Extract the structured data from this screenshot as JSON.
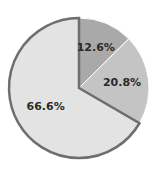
{
  "chart_data": {
    "type": "pie",
    "title": "",
    "start_angle_deg": 0,
    "direction": "clockwise",
    "slices": [
      {
        "label": "12.6%",
        "value": 12.6,
        "color": "#a9a9a9",
        "outlined": false
      },
      {
        "label": "20.8%",
        "value": 20.8,
        "color": "#c4c4c4",
        "outlined": false
      },
      {
        "label": "66.6%",
        "value": 66.6,
        "color": "#e3e3e3",
        "outlined": true
      }
    ],
    "outline_color": "#6e6e6e",
    "separator_color": "#ffffff",
    "legend": "none"
  }
}
